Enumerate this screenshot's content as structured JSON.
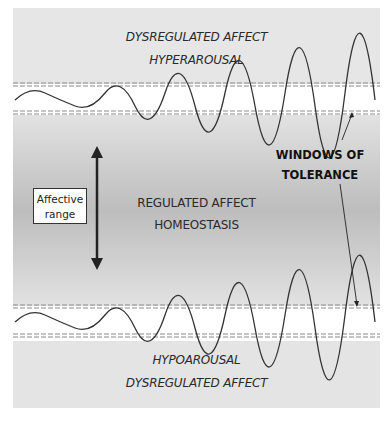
{
  "diagram": {
    "title": "Windows of Tolerance",
    "zones": {
      "top": {
        "line1": "DYSREGULATED AFFECT",
        "line2": "HYPERAROUSAL"
      },
      "middle": {
        "line1": "REGULATED AFFECT",
        "line2": "HOMEOSTASIS"
      },
      "bottom": {
        "line1": "HYPOAROUSAL",
        "line2": "DYSREGULATED AFFECT"
      }
    },
    "range_box": {
      "line1": "Affective",
      "line2": "range"
    },
    "callout": {
      "line1": "WINDOWS OF",
      "line2": "TOLERANCE"
    },
    "colors": {
      "outer_band": "#e6e6e6",
      "middle_center": "#bdbdbd",
      "line": "#333333",
      "dash": "#888888"
    }
  }
}
